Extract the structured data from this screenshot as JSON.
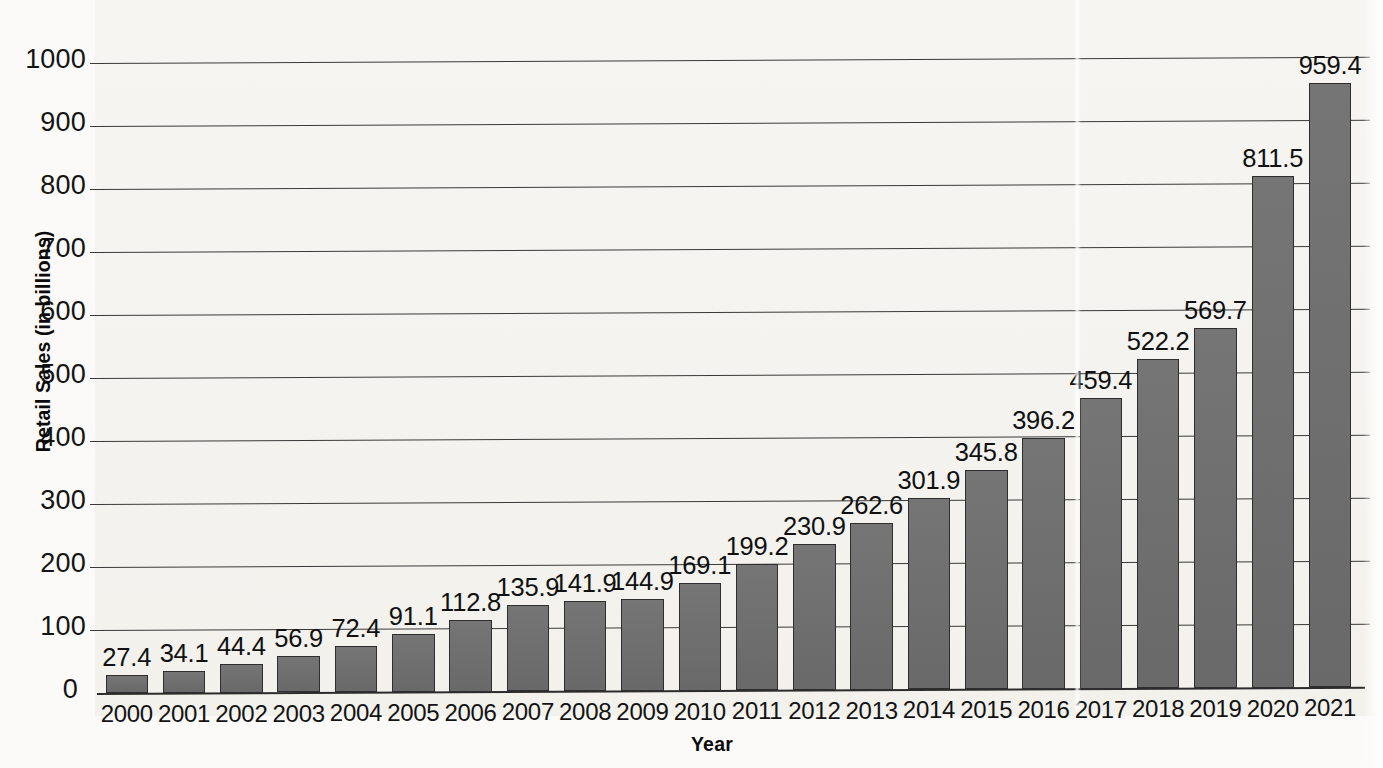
{
  "chart_data": {
    "type": "bar",
    "title": "",
    "xlabel": "Year",
    "ylabel": "Retail Sales (in billions)",
    "categories": [
      "2000",
      "2001",
      "2002",
      "2003",
      "2004",
      "2005",
      "2006",
      "2007",
      "2008",
      "2009",
      "2010",
      "2011",
      "2012",
      "2013",
      "2014",
      "2015",
      "2016",
      "2017",
      "2018",
      "2019",
      "2020",
      "2021"
    ],
    "values": [
      27.4,
      34.1,
      44.4,
      56.9,
      72.4,
      91.1,
      112.8,
      135.9,
      141.9,
      144.9,
      169.1,
      199.2,
      230.9,
      262.6,
      301.9,
      345.8,
      396.2,
      459.4,
      522.2,
      569.7,
      811.5,
      959.4
    ],
    "value_labels": [
      "27.4",
      "34.1",
      "44.4",
      "56.9",
      "72.4",
      "91.1",
      "112.8",
      "135.9",
      "141.9",
      "144.9",
      "169.1",
      "199.2",
      "230.9",
      "262.6",
      "301.9",
      "345.8",
      "396.2",
      "459.4",
      "522.2",
      "569.7",
      "811.5",
      "959.4"
    ],
    "yticks": [
      0,
      100,
      200,
      300,
      400,
      500,
      600,
      700,
      800,
      900,
      1000
    ],
    "ytick_labels": [
      "0",
      "100",
      "200",
      "300",
      "400",
      "500",
      "600",
      "700",
      "800",
      "900",
      "1000"
    ],
    "ylim": [
      0,
      1000
    ],
    "grid": true,
    "legend": "none",
    "series_name": "Retail Sales",
    "bar_color": "#6f6f6f",
    "bar_edge_color": "#2e2e2e",
    "gridline_color": "#3a3a3a",
    "background_color": "#f4f3ef",
    "text_color": "#111111"
  }
}
